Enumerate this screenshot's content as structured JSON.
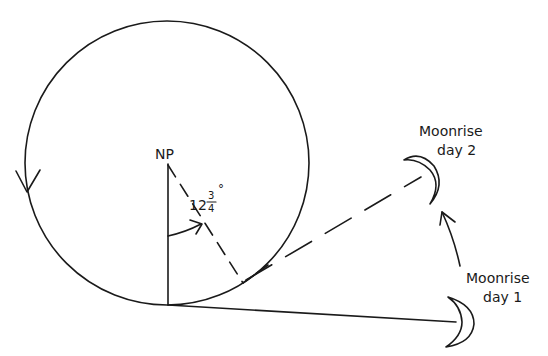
{
  "diagram": {
    "labels": {
      "pole": "NP",
      "angle_whole": "12",
      "angle_num": "3",
      "angle_den": "4",
      "angle_unit": "°",
      "moon_day2_line1": "Moonrise",
      "moon_day2_line2": "day 2",
      "moon_day1_line1": "Moonrise",
      "moon_day1_line2": "day 1"
    },
    "angle_value": "12 3/4°",
    "colors": {
      "ink": "#1a1a1a",
      "background": "#ffffff"
    },
    "icons": {
      "rotation_direction": "arrow-down-icon",
      "moon_day1": "crescent-moon-icon",
      "moon_day2": "crescent-moon-icon",
      "moon_motion": "curved-arrow-up-icon",
      "angle_arc": "angle-arc-arrow-icon"
    }
  }
}
